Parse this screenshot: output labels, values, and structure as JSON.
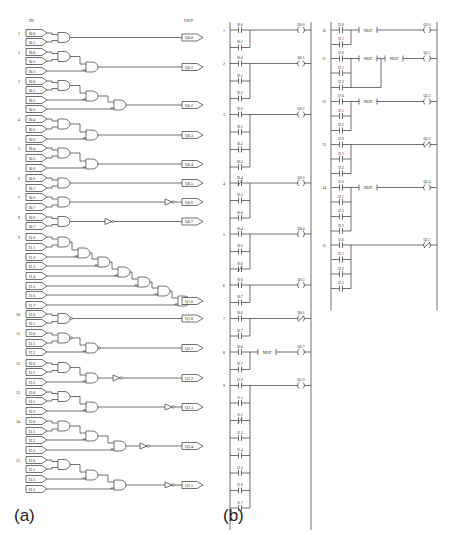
{
  "panel_a": {
    "label": "(a)",
    "header_in": "IN",
    "header_out": "OUT",
    "rungs": [
      {
        "n": "1",
        "inputs": [
          "I0.0",
          "I0.1"
        ],
        "output": "Q0.0",
        "gates": "AND",
        "not": false
      },
      {
        "n": "2",
        "inputs": [
          "I0.0",
          "I0.1",
          "I0.2"
        ],
        "output": "Q0.1",
        "gates": "AND-chain",
        "not": false
      },
      {
        "n": "3",
        "inputs": [
          "I0.0",
          "I0.1",
          "I0.2",
          "I0.3"
        ],
        "output": "Q0.2",
        "gates": "AND-chain",
        "not": false
      },
      {
        "n": "4",
        "inputs": [
          "I0.4",
          "I0.5",
          "I0.6"
        ],
        "output": "Q0.3",
        "gates": "AND-chain",
        "not": false
      },
      {
        "n": "5",
        "inputs": [
          "I0.4",
          "I0.5",
          "I0.6"
        ],
        "output": "Q0.4",
        "gates": "AND-chain (inverted input)",
        "not": false
      },
      {
        "n": "6",
        "inputs": [
          "I0.6",
          "I0.7"
        ],
        "output": "Q0.5",
        "gates": "AND",
        "not": false
      },
      {
        "n": "7",
        "inputs": [
          "I0.6",
          "I0.7"
        ],
        "output": "Q0.6",
        "gates": "AND",
        "not": true
      },
      {
        "n": "8",
        "inputs": [
          "I0.6",
          "I0.7"
        ],
        "output": "Q0.7",
        "gates": "AND",
        "not": true
      },
      {
        "n": "9",
        "inputs": [
          "I1.0",
          "I1.1",
          "I1.2",
          "I1.3",
          "I1.4",
          "I1.5",
          "I1.6",
          "I1.7"
        ],
        "output": "Q1.0",
        "gates": "AND-chain",
        "not": false
      },
      {
        "n": "10",
        "inputs": [
          "I2.0",
          "I2.1"
        ],
        "output": "Q1.0",
        "gates": "NAND",
        "not": false
      },
      {
        "n": "11",
        "inputs": [
          "I2.0",
          "I2.1",
          "I2.2"
        ],
        "output": "Q2.1",
        "gates": "NAND-chain",
        "not": false
      },
      {
        "n": "12",
        "inputs": [
          "I2.0",
          "I2.1",
          "I2.2"
        ],
        "output": "Q2.2",
        "gates": "AND-chain",
        "not": true
      },
      {
        "n": "13",
        "inputs": [
          "I2.0",
          "I2.1",
          "I2.2"
        ],
        "output": "Q2.3",
        "gates": "AND-chain",
        "not": true
      },
      {
        "n": "14",
        "inputs": [
          "I2.0",
          "I2.1",
          "I2.2",
          "I2.3"
        ],
        "output": "Q2.4",
        "gates": "AND-chain",
        "not": true
      },
      {
        "n": "15",
        "inputs": [
          "I2.0",
          "I2.1",
          "I2.2",
          "I2.3"
        ],
        "output": "Q2.5",
        "gates": "AND-chain",
        "not": true
      }
    ]
  },
  "panel_b": {
    "label": "(b)",
    "not_label": "NOT",
    "col1": [
      {
        "n": "1",
        "contacts": [
          {
            "t": "I0.0",
            "nc": false
          },
          {
            "t": "I0.1",
            "nc": false
          }
        ],
        "coil": "Q0.0",
        "coil_nc": false,
        "not": false
      },
      {
        "n": "2",
        "contacts": [
          {
            "t": "I0.0",
            "nc": false
          },
          {
            "t": "I0.1",
            "nc": false
          },
          {
            "t": "I0.2",
            "nc": false
          }
        ],
        "coil": "Q0.1",
        "coil_nc": false,
        "not": false
      },
      {
        "n": "3",
        "contacts": [
          {
            "t": "I0.0",
            "nc": false
          },
          {
            "t": "I0.1",
            "nc": false
          },
          {
            "t": "I0.2",
            "nc": false
          },
          {
            "t": "I0.3",
            "nc": false
          }
        ],
        "coil": "Q0.2",
        "coil_nc": false,
        "not": false
      },
      {
        "n": "4",
        "contacts": [
          {
            "t": "I0.4",
            "nc": true
          },
          {
            "t": "I0.5",
            "nc": false
          },
          {
            "t": "I0.6",
            "nc": false
          }
        ],
        "coil": "Q0.3",
        "coil_nc": false,
        "not": false
      },
      {
        "n": "5",
        "contacts": [
          {
            "t": "I0.4",
            "nc": false
          },
          {
            "t": "I0.5",
            "nc": false
          },
          {
            "t": "I0.6",
            "nc": true
          }
        ],
        "coil": "Q0.4",
        "coil_nc": false,
        "not": false
      },
      {
        "n": "6",
        "contacts": [
          {
            "t": "I0.6",
            "nc": false
          },
          {
            "t": "I0.7",
            "nc": false
          }
        ],
        "coil": "Q0.5",
        "coil_nc": false,
        "not": false
      },
      {
        "n": "7",
        "contacts": [
          {
            "t": "I0.6",
            "nc": false
          },
          {
            "t": "I0.7",
            "nc": false
          }
        ],
        "coil": "Q0.6",
        "coil_nc": true,
        "not": false
      },
      {
        "n": "8",
        "contacts": [
          {
            "t": "I0.6",
            "nc": false
          },
          {
            "t": "I0.7",
            "nc": false
          }
        ],
        "coil": "Q0.7",
        "coil_nc": false,
        "not": true
      },
      {
        "n": "9",
        "contacts": [
          {
            "t": "I1.0",
            "nc": false
          },
          {
            "t": "I1.1",
            "nc": false
          },
          {
            "t": "I1.2",
            "nc": true
          },
          {
            "t": "I1.3",
            "nc": false
          },
          {
            "t": "I1.4",
            "nc": false
          },
          {
            "t": "I1.5",
            "nc": false
          },
          {
            "t": "I1.6",
            "nc": false
          },
          {
            "t": "I1.7",
            "nc": false
          }
        ],
        "coil": "Q1.0",
        "coil_nc": false,
        "not": false
      }
    ],
    "col2": [
      {
        "n": "10",
        "contacts": [
          {
            "t": "I2.0",
            "nc": false
          },
          {
            "t": "I2.1",
            "nc": false
          }
        ],
        "coil": "Q2.0",
        "coil_nc": false,
        "not": true
      },
      {
        "n": "11",
        "contacts": [
          {
            "t": "I2.0",
            "nc": false
          },
          {
            "t": "I2.1",
            "nc": false
          },
          {
            "t": "I2.2",
            "nc": false
          }
        ],
        "coil": "Q2.1",
        "coil_nc": false,
        "not": true,
        "double_not": true
      },
      {
        "n": "12",
        "contacts": [
          {
            "t": "I2.0",
            "nc": false
          },
          {
            "t": "I2.1",
            "nc": false
          },
          {
            "t": "I2.2",
            "nc": false
          }
        ],
        "coil": "Q2.2",
        "coil_nc": false,
        "not": true
      },
      {
        "n": "13",
        "contacts": [
          {
            "t": "I2.0",
            "nc": false
          },
          {
            "t": "I2.1",
            "nc": false
          },
          {
            "t": "I2.2",
            "nc": false
          }
        ],
        "coil": "Q2.3",
        "coil_nc": true,
        "not": false
      },
      {
        "n": "14",
        "contacts": [
          {
            "t": "I2.0",
            "nc": false
          },
          {
            "t": "I2.1",
            "nc": false
          },
          {
            "t": "I2.2",
            "nc": false
          },
          {
            "t": "I2.3",
            "nc": false
          }
        ],
        "coil": "Q2.4",
        "coil_nc": false,
        "not": true
      },
      {
        "n": "15",
        "contacts": [
          {
            "t": "I2.0",
            "nc": false
          },
          {
            "t": "I2.1",
            "nc": false
          },
          {
            "t": "I2.2",
            "nc": false
          },
          {
            "t": "I2.3",
            "nc": false
          }
        ],
        "coil": "Q2.5",
        "coil_nc": true,
        "not": false
      }
    ]
  }
}
